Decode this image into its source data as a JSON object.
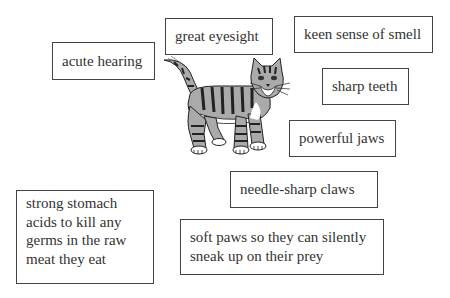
{
  "diagram": {
    "labels": [
      {
        "id": "acute-hearing",
        "text": "acute hearing"
      },
      {
        "id": "great-eyesight",
        "text": "great eyesight"
      },
      {
        "id": "keen-sense-of-smell",
        "text": "keen sense of smell"
      },
      {
        "id": "sharp-teeth",
        "text": "sharp teeth"
      },
      {
        "id": "powerful-jaws",
        "text": "powerful jaws"
      },
      {
        "id": "needle-sharp-claws",
        "text": "needle-sharp claws"
      },
      {
        "id": "strong-stomach",
        "lines": [
          "strong stomach",
          "acids to kill any",
          "germs in the raw",
          "meat they eat"
        ]
      },
      {
        "id": "soft-paws",
        "lines": [
          "soft paws so they can silently",
          "sneak up on their prey"
        ]
      }
    ]
  }
}
